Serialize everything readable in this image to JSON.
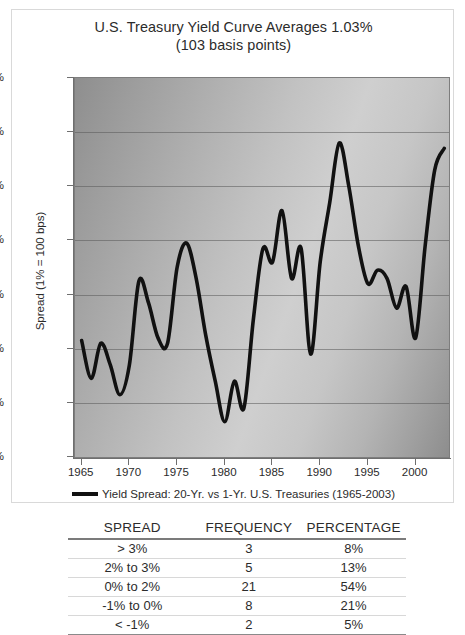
{
  "chart_card": {
    "title_line1": "U.S. Treasury Yield Curve Averages 1.03%",
    "title_line2": "(103 basis points)",
    "legend_label": "Yield Spread: 20-Yr. vs 1-Yr. U.S. Treasuries (1965-2003)"
  },
  "chart_data": {
    "type": "line",
    "title": "U.S. Treasury Yield Curve Averages 1.03% (103 basis points)",
    "xlabel": "",
    "ylabel": "Spread (1% = 100 bps)",
    "xlim": [
      1964.3,
      2003.5
    ],
    "ylim": [
      -2,
      5
    ],
    "ytick_labels": [
      "5%",
      "4%",
      "3%",
      "2%",
      "1%",
      "0%",
      "-1%",
      "-2%"
    ],
    "ytick_values": [
      5,
      4,
      3,
      2,
      1,
      0,
      -1,
      -2
    ],
    "xtick_labels": [
      "1965",
      "1970",
      "1975",
      "1980",
      "1985",
      "1990",
      "1995",
      "2000"
    ],
    "xtick_values": [
      1965,
      1970,
      1975,
      1980,
      1985,
      1990,
      1995,
      2000
    ],
    "grid": true,
    "legend_position": "below",
    "series": [
      {
        "name": "Yield Spread: 20-Yr. vs 1-Yr. U.S. Treasuries (1965-2003)",
        "color": "#111111",
        "x": [
          1965,
          1966,
          1967,
          1968,
          1969,
          1970,
          1971,
          1972,
          1973,
          1974,
          1975,
          1976,
          1977,
          1978,
          1979,
          1980,
          1981,
          1982,
          1983,
          1984,
          1985,
          1986,
          1987,
          1988,
          1989,
          1990,
          1991,
          1992,
          1993,
          1994,
          1995,
          1996,
          1997,
          1998,
          1999,
          2000,
          2001,
          2002,
          2003
        ],
        "values": [
          0.15,
          -0.55,
          0.1,
          -0.3,
          -0.85,
          -0.3,
          1.25,
          0.85,
          0.2,
          0.1,
          1.5,
          1.95,
          1.3,
          0.25,
          -0.6,
          -1.35,
          -0.6,
          -1.1,
          0.55,
          1.85,
          1.6,
          2.55,
          1.3,
          1.85,
          -0.1,
          1.6,
          2.7,
          3.8,
          3.0,
          1.9,
          1.2,
          1.45,
          1.3,
          0.75,
          1.15,
          0.2,
          1.9,
          3.3,
          3.7
        ]
      }
    ]
  },
  "table": {
    "headers": [
      "SPREAD",
      "FREQUENCY",
      "PERCENTAGE"
    ],
    "rows": [
      {
        "spread": "> 3%",
        "frequency": "3",
        "percentage": "8%"
      },
      {
        "spread": "2% to 3%",
        "frequency": "5",
        "percentage": "13%"
      },
      {
        "spread": "0% to 2%",
        "frequency": "21",
        "percentage": "54%"
      },
      {
        "spread": "-1% to 0%",
        "frequency": "8",
        "percentage": "21%"
      },
      {
        "spread": "< -1%",
        "frequency": "2",
        "percentage": "5%"
      }
    ]
  }
}
